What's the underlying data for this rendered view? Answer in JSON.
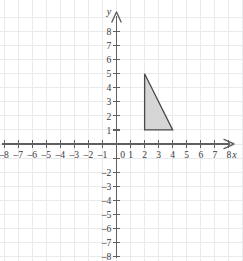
{
  "chart_data": {
    "type": "scatter",
    "title": "",
    "subtitle": "",
    "xlabel": "x",
    "ylabel": "y",
    "xlim": [
      -8,
      8
    ],
    "ylim": [
      -8,
      8
    ],
    "grid": true,
    "legend": null,
    "x_ticks": [
      -8,
      -7,
      -6,
      -5,
      -4,
      -3,
      -2,
      -1,
      1,
      2,
      3,
      4,
      5,
      6,
      7,
      8
    ],
    "y_ticks": [
      -8,
      -7,
      -6,
      -5,
      -4,
      -3,
      -2,
      1,
      2,
      3,
      4,
      5,
      6,
      7,
      8
    ],
    "x_tick_labels": [
      "-8",
      "-7",
      "-6",
      "-5",
      "-4",
      "-3",
      "-2",
      "-1",
      "1",
      "2",
      "3",
      "4",
      "5",
      "6",
      "7",
      "8"
    ],
    "y_tick_labels": [
      "-8",
      "-7",
      "-6",
      "-5",
      "-4",
      "-3",
      "-2",
      "1",
      "2",
      "3",
      "4",
      "5",
      "6",
      "7",
      "8"
    ],
    "origin_label": "0",
    "tick_step": 1,
    "shapes": [
      {
        "name": "right-triangle",
        "type": "polygon",
        "vertices": [
          [
            2,
            5
          ],
          [
            2,
            1
          ],
          [
            4,
            1
          ]
        ],
        "fill": "#d6d6d6",
        "stroke": "#4a4a4c"
      }
    ],
    "annotations": []
  },
  "axes": {
    "x_axis_name": "x",
    "y_axis_name": "y"
  },
  "colors": {
    "grid": "#e9eaec",
    "axis": "#5f6063",
    "label": "#3a3a3c",
    "shape_fill": "#d6d6d6",
    "shape_stroke": "#4a4a4c",
    "background": "#ffffff"
  }
}
